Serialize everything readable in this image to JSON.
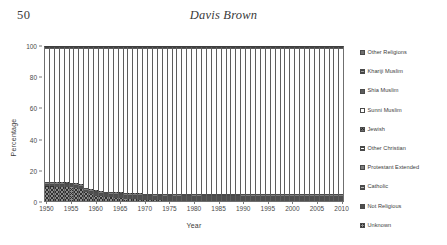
{
  "page": {
    "folio": "50",
    "running_head": "Davis Brown"
  },
  "chart_data": {
    "type": "bar",
    "stacked": true,
    "title": "",
    "xlabel": "Year",
    "ylabel": "Percentage",
    "ylim": [
      0,
      100
    ],
    "yticks": [
      0,
      20,
      40,
      60,
      80,
      100
    ],
    "xticks": [
      1950,
      1955,
      1960,
      1965,
      1970,
      1975,
      1980,
      1985,
      1990,
      1995,
      2000,
      2005,
      2010
    ],
    "xlim": [
      1950,
      2010
    ],
    "grid": false,
    "legend_position": "right",
    "x": [
      1950,
      1951,
      1952,
      1953,
      1954,
      1955,
      1956,
      1957,
      1958,
      1959,
      1960,
      1961,
      1962,
      1963,
      1964,
      1965,
      1966,
      1967,
      1968,
      1969,
      1970,
      1971,
      1972,
      1973,
      1974,
      1975,
      1976,
      1977,
      1978,
      1979,
      1980,
      1981,
      1982,
      1983,
      1984,
      1985,
      1986,
      1987,
      1988,
      1989,
      1990,
      1991,
      1992,
      1993,
      1994,
      1995,
      1996,
      1997,
      1998,
      1999,
      2000,
      2001,
      2002,
      2003,
      2004,
      2005,
      2006,
      2007,
      2008,
      2009,
      2010
    ],
    "series": [
      {
        "name": "Unknown",
        "fill": "#8c8c8c",
        "pattern": "crosshatch",
        "values": [
          9.5,
          9.5,
          9.4,
          9.3,
          9.2,
          9.1,
          8.6,
          7.9,
          5.6,
          4.4,
          3.6,
          3.1,
          2.7,
          2.4,
          2.1,
          1.8,
          1.5,
          1.2,
          1.0,
          0.8,
          0.6,
          0.5,
          0.4,
          0.4,
          0.3,
          0.3,
          0.2,
          0.2,
          0.2,
          0.2,
          0.1,
          0.1,
          0.1,
          0.1,
          0.1,
          0.1,
          0.1,
          0.1,
          0.1,
          0.1,
          0.0,
          0.0,
          0.0,
          0.0,
          0.0,
          0.0,
          0.0,
          0.0,
          0.0,
          0.0,
          0.0,
          0.0,
          0.0,
          0.0,
          0.0,
          0.0,
          0.0,
          0.0,
          0.0,
          0.0,
          0.0
        ]
      },
      {
        "name": "Not Religious",
        "fill": "#4f4f4f",
        "pattern": "solid",
        "values": [
          1.1,
          1.1,
          1.1,
          1.1,
          1.1,
          1.1,
          1.2,
          1.2,
          1.3,
          1.4,
          1.5,
          1.6,
          1.7,
          1.8,
          1.9,
          2.0,
          2.1,
          2.2,
          2.3,
          2.4,
          2.5,
          2.6,
          2.6,
          2.7,
          2.7,
          2.8,
          2.8,
          2.8,
          2.9,
          2.9,
          2.9,
          2.9,
          3.0,
          3.0,
          3.0,
          3.0,
          3.0,
          3.0,
          3.0,
          3.0,
          3.0,
          3.0,
          3.0,
          3.0,
          3.0,
          3.0,
          3.0,
          3.0,
          3.0,
          3.0,
          3.0,
          3.0,
          3.0,
          3.0,
          3.0,
          3.0,
          3.0,
          3.0,
          3.0,
          3.0,
          3.0
        ]
      },
      {
        "name": "Catholic",
        "fill": "#b5b5b5",
        "pattern": "dot",
        "values": [
          0.6,
          0.6,
          0.6,
          0.6,
          0.6,
          0.6,
          0.6,
          0.6,
          0.6,
          0.6,
          0.6,
          0.6,
          0.6,
          0.6,
          0.6,
          0.6,
          0.6,
          0.6,
          0.6,
          0.6,
          0.6,
          0.6,
          0.6,
          0.6,
          0.6,
          0.6,
          0.6,
          0.6,
          0.6,
          0.6,
          0.6,
          0.6,
          0.6,
          0.6,
          0.6,
          0.6,
          0.6,
          0.6,
          0.6,
          0.6,
          0.6,
          0.6,
          0.6,
          0.6,
          0.6,
          0.6,
          0.6,
          0.6,
          0.6,
          0.6,
          0.6,
          0.6,
          0.6,
          0.6,
          0.6,
          0.6,
          0.6,
          0.6,
          0.6,
          0.6,
          0.6
        ]
      },
      {
        "name": "Protestant Extended",
        "fill": "#7d7d7d",
        "pattern": "solid",
        "values": [
          0.5,
          0.5,
          0.5,
          0.5,
          0.5,
          0.5,
          0.5,
          0.5,
          0.5,
          0.5,
          0.5,
          0.5,
          0.5,
          0.5,
          0.5,
          0.5,
          0.5,
          0.5,
          0.5,
          0.5,
          0.5,
          0.5,
          0.5,
          0.5,
          0.5,
          0.5,
          0.5,
          0.5,
          0.5,
          0.5,
          0.5,
          0.5,
          0.5,
          0.5,
          0.5,
          0.5,
          0.5,
          0.5,
          0.5,
          0.5,
          0.5,
          0.5,
          0.5,
          0.5,
          0.5,
          0.5,
          0.5,
          0.5,
          0.5,
          0.5,
          0.5,
          0.5,
          0.5,
          0.5,
          0.5,
          0.5,
          0.5,
          0.5,
          0.5,
          0.5,
          0.5
        ]
      },
      {
        "name": "Other Christian",
        "fill": "#ffffff",
        "pattern": "hline",
        "values": [
          0.4,
          0.4,
          0.4,
          0.4,
          0.4,
          0.4,
          0.4,
          0.4,
          0.4,
          0.4,
          0.4,
          0.4,
          0.4,
          0.4,
          0.4,
          0.4,
          0.4,
          0.4,
          0.4,
          0.4,
          0.4,
          0.4,
          0.4,
          0.4,
          0.4,
          0.4,
          0.4,
          0.4,
          0.4,
          0.4,
          0.4,
          0.4,
          0.4,
          0.4,
          0.4,
          0.4,
          0.4,
          0.4,
          0.4,
          0.4,
          0.4,
          0.4,
          0.4,
          0.4,
          0.4,
          0.4,
          0.4,
          0.4,
          0.4,
          0.4,
          0.4,
          0.4,
          0.4,
          0.4,
          0.4,
          0.4,
          0.4,
          0.4,
          0.4,
          0.4,
          0.4
        ]
      },
      {
        "name": "Jewish",
        "fill": "#6a6a6a",
        "pattern": "cross",
        "values": [
          0.3,
          0.3,
          0.3,
          0.3,
          0.3,
          0.3,
          0.3,
          0.3,
          0.3,
          0.3,
          0.3,
          0.3,
          0.3,
          0.3,
          0.3,
          0.3,
          0.3,
          0.3,
          0.3,
          0.3,
          0.3,
          0.3,
          0.3,
          0.3,
          0.3,
          0.3,
          0.3,
          0.3,
          0.3,
          0.3,
          0.3,
          0.3,
          0.3,
          0.3,
          0.3,
          0.3,
          0.3,
          0.3,
          0.3,
          0.3,
          0.3,
          0.3,
          0.3,
          0.3,
          0.3,
          0.3,
          0.3,
          0.3,
          0.3,
          0.3,
          0.3,
          0.3,
          0.3,
          0.3,
          0.3,
          0.3,
          0.3,
          0.3,
          0.3,
          0.3,
          0.3
        ]
      },
      {
        "name": "Sunni Muslim",
        "fill": "#ffffff",
        "pattern": "solid",
        "values": [
          87.0,
          87.0,
          87.1,
          87.2,
          87.3,
          87.4,
          87.9,
          88.6,
          90.8,
          91.9,
          92.7,
          93.1,
          93.4,
          93.6,
          93.9,
          94.1,
          94.4,
          94.7,
          94.9,
          95.0,
          95.2,
          95.3,
          95.4,
          95.3,
          95.4,
          95.3,
          95.4,
          95.4,
          95.3,
          95.3,
          95.4,
          95.4,
          95.4,
          95.4,
          95.4,
          95.4,
          95.4,
          95.4,
          95.4,
          95.4,
          95.5,
          95.5,
          95.5,
          95.5,
          95.5,
          95.5,
          95.5,
          95.5,
          95.5,
          95.5,
          95.5,
          95.5,
          95.5,
          95.5,
          95.5,
          95.5,
          95.5,
          95.5,
          95.5,
          95.5,
          95.5
        ]
      },
      {
        "name": "Shia Muslim",
        "fill": "#5c5c5c",
        "pattern": "solid",
        "values": [
          0.4,
          0.4,
          0.4,
          0.4,
          0.4,
          0.4,
          0.4,
          0.4,
          0.4,
          0.4,
          0.4,
          0.4,
          0.4,
          0.4,
          0.4,
          0.4,
          0.4,
          0.4,
          0.4,
          0.4,
          0.4,
          0.4,
          0.4,
          0.4,
          0.4,
          0.4,
          0.4,
          0.4,
          0.4,
          0.4,
          0.4,
          0.4,
          0.4,
          0.4,
          0.4,
          0.4,
          0.4,
          0.4,
          0.4,
          0.4,
          0.4,
          0.4,
          0.4,
          0.4,
          0.4,
          0.4,
          0.4,
          0.4,
          0.4,
          0.4,
          0.4,
          0.4,
          0.4,
          0.4,
          0.4,
          0.4,
          0.4,
          0.4,
          0.4,
          0.4,
          0.4
        ]
      },
      {
        "name": "Khariji Muslim",
        "fill": "#9a9a9a",
        "pattern": "dot",
        "values": [
          0.4,
          0.4,
          0.4,
          0.4,
          0.4,
          0.4,
          0.4,
          0.4,
          0.4,
          0.4,
          0.4,
          0.4,
          0.4,
          0.4,
          0.4,
          0.4,
          0.4,
          0.4,
          0.4,
          0.4,
          0.4,
          0.4,
          0.4,
          0.4,
          0.4,
          0.4,
          0.4,
          0.4,
          0.4,
          0.4,
          0.4,
          0.4,
          0.4,
          0.4,
          0.4,
          0.4,
          0.4,
          0.4,
          0.4,
          0.4,
          0.4,
          0.4,
          0.4,
          0.4,
          0.4,
          0.4,
          0.4,
          0.4,
          0.4,
          0.4,
          0.4,
          0.4,
          0.4,
          0.4,
          0.4,
          0.4,
          0.4,
          0.4,
          0.4,
          0.4,
          0.4
        ]
      },
      {
        "name": "Other Religions",
        "fill": "#6e6e6e",
        "pattern": "solid",
        "values": [
          0.3,
          0.3,
          0.3,
          0.3,
          0.3,
          0.3,
          0.3,
          0.3,
          0.3,
          0.3,
          0.3,
          0.3,
          0.3,
          0.3,
          0.3,
          0.3,
          0.3,
          0.3,
          0.3,
          0.3,
          0.3,
          0.3,
          0.3,
          0.3,
          0.3,
          0.3,
          0.3,
          0.3,
          0.3,
          0.3,
          0.3,
          0.3,
          0.3,
          0.3,
          0.3,
          0.3,
          0.3,
          0.3,
          0.3,
          0.3,
          0.3,
          0.3,
          0.3,
          0.3,
          0.3,
          0.3,
          0.3,
          0.3,
          0.3,
          0.3,
          0.3,
          0.3,
          0.3,
          0.3,
          0.3,
          0.3,
          0.3,
          0.3,
          0.3,
          0.3,
          0.3
        ]
      }
    ],
    "legend": [
      {
        "label": "Other Religions",
        "fill": "#6e6e6e",
        "pattern": "solid"
      },
      {
        "label": "Khariji Muslim",
        "fill": "#9a9a9a",
        "pattern": "dot"
      },
      {
        "label": "Shia Muslim",
        "fill": "#5c5c5c",
        "pattern": "solid"
      },
      {
        "label": "Sunni Muslim",
        "fill": "#ffffff",
        "pattern": "solid"
      },
      {
        "label": "Jewish",
        "fill": "#6a6a6a",
        "pattern": "cross"
      },
      {
        "label": "Other Christian",
        "fill": "#ffffff",
        "pattern": "hline"
      },
      {
        "label": "Protestant Extended",
        "fill": "#7d7d7d",
        "pattern": "solid"
      },
      {
        "label": "Catholic",
        "fill": "#b5b5b5",
        "pattern": "dot"
      },
      {
        "label": "Not Religious",
        "fill": "#4f4f4f",
        "pattern": "solid"
      },
      {
        "label": "Unknown",
        "fill": "#8c8c8c",
        "pattern": "crosshatch"
      }
    ]
  }
}
